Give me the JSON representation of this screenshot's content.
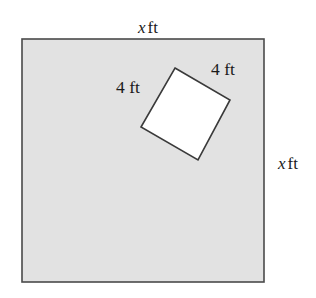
{
  "figure": {
    "kind": "geometry-diagram",
    "colors": {
      "page_background": "#ffffff",
      "outer_square_fill": "#e2e2e2",
      "outer_square_stroke": "#4a4a4a",
      "inner_square_fill": "#ffffff",
      "inner_square_stroke": "#3a3a3a",
      "label_text": "#1a1a1a"
    },
    "outer_square": {
      "name": "outer-square",
      "fill": "#e2e2e2",
      "stroke": "#4a4a4a",
      "stroke_width": 1.6,
      "x": 22,
      "y": 39,
      "width": 242,
      "height": 243,
      "side_label": "x ft"
    },
    "inner_square": {
      "name": "inner-tilted-square",
      "fill": "#ffffff",
      "stroke": "#3a3a3a",
      "stroke_width": 1.6,
      "points": "175,68 230,100 198,160 141,127",
      "vertices": [
        {
          "name": "top",
          "x": 175,
          "y": 68
        },
        {
          "name": "right",
          "x": 230,
          "y": 100
        },
        {
          "name": "bottom",
          "x": 198,
          "y": 160
        },
        {
          "name": "left",
          "x": 141,
          "y": 127
        }
      ],
      "side_label": "4 ft"
    },
    "labels": {
      "top": {
        "variable": "x",
        "unit": "ft"
      },
      "right": {
        "variable": "x",
        "unit": "ft"
      },
      "inner_left": {
        "value": "4",
        "unit": "ft"
      },
      "inner_right": {
        "value": "4",
        "unit": "ft"
      }
    }
  }
}
